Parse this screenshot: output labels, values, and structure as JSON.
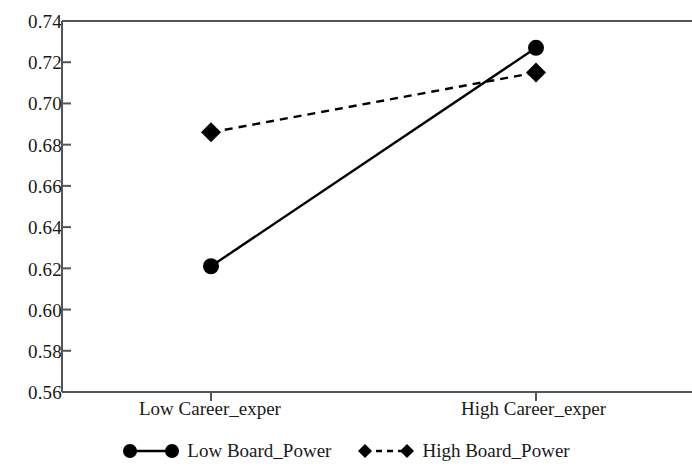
{
  "chart_data": {
    "type": "line",
    "title": "",
    "subtitle": "",
    "xlabel": "",
    "ylabel": "",
    "categories": [
      "Low  Career_exper",
      "High  Career_exper"
    ],
    "x": [
      0,
      1
    ],
    "ylim": [
      0.56,
      0.74
    ],
    "ytick_labels": [
      "0.74",
      "0.72",
      "0.70",
      "0.68",
      "0.66",
      "0.64",
      "0.62",
      "0.60",
      "0.58",
      "0.56"
    ],
    "yticks": [
      0.74,
      0.72,
      0.7,
      0.68,
      0.66,
      0.64,
      0.62,
      0.6,
      0.58,
      0.56
    ],
    "grid": false,
    "legend_position": "bottom-center",
    "series": [
      {
        "name": "Low  Board_Power",
        "values": [
          0.621,
          0.727
        ],
        "marker": "circle",
        "linestyle": "solid",
        "color": "#000000"
      },
      {
        "name": "High  Board_Power",
        "values": [
          0.686,
          0.715
        ],
        "marker": "diamond",
        "linestyle": "dashed",
        "color": "#000000"
      }
    ],
    "annotations": []
  },
  "axes": {
    "frame_color": "#555555",
    "tick_color": "#555555"
  },
  "legend": {
    "items": [
      {
        "label": "Low  Board_Power",
        "marker": "circle-marker",
        "line": "solid-line"
      },
      {
        "label": "High  Board_Power",
        "marker": "diamond-marker",
        "line": "dashed-line"
      }
    ]
  }
}
